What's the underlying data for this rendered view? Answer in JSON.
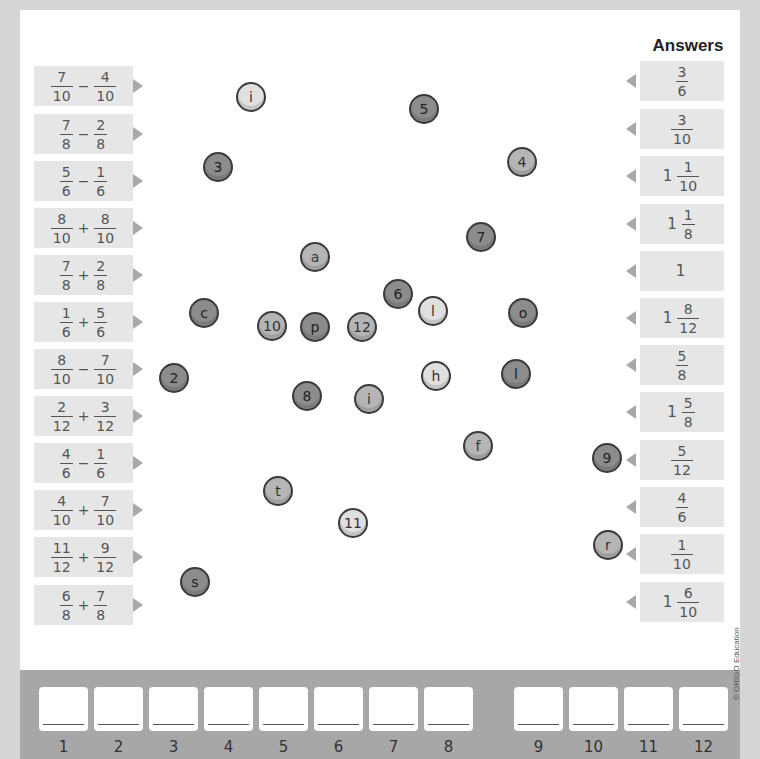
{
  "header": {
    "answers_title": "Answers"
  },
  "questions": [
    {
      "a_num": "7",
      "a_den": "10",
      "op": "−",
      "b_num": "4",
      "b_den": "10"
    },
    {
      "a_num": "7",
      "a_den": "8",
      "op": "−",
      "b_num": "2",
      "b_den": "8"
    },
    {
      "a_num": "5",
      "a_den": "6",
      "op": "−",
      "b_num": "1",
      "b_den": "6"
    },
    {
      "a_num": "8",
      "a_den": "10",
      "op": "+",
      "b_num": "8",
      "b_den": "10"
    },
    {
      "a_num": "7",
      "a_den": "8",
      "op": "+",
      "b_num": "2",
      "b_den": "8"
    },
    {
      "a_num": "1",
      "a_den": "6",
      "op": "+",
      "b_num": "5",
      "b_den": "6"
    },
    {
      "a_num": "8",
      "a_den": "10",
      "op": "−",
      "b_num": "7",
      "b_den": "10"
    },
    {
      "a_num": "2",
      "a_den": "12",
      "op": "+",
      "b_num": "3",
      "b_den": "12"
    },
    {
      "a_num": "4",
      "a_den": "6",
      "op": "−",
      "b_num": "1",
      "b_den": "6"
    },
    {
      "a_num": "4",
      "a_den": "10",
      "op": "+",
      "b_num": "7",
      "b_den": "10"
    },
    {
      "a_num": "11",
      "a_den": "12",
      "op": "+",
      "b_num": "9",
      "b_den": "12"
    },
    {
      "a_num": "6",
      "a_den": "8",
      "op": "+",
      "b_num": "7",
      "b_den": "8"
    }
  ],
  "answers": [
    {
      "whole": "",
      "num": "3",
      "den": "6"
    },
    {
      "whole": "",
      "num": "3",
      "den": "10"
    },
    {
      "whole": "1",
      "num": "1",
      "den": "10"
    },
    {
      "whole": "1",
      "num": "1",
      "den": "8"
    },
    {
      "whole": "1",
      "num": "",
      "den": ""
    },
    {
      "whole": "1",
      "num": "8",
      "den": "12"
    },
    {
      "whole": "",
      "num": "5",
      "den": "8"
    },
    {
      "whole": "1",
      "num": "5",
      "den": "8"
    },
    {
      "whole": "",
      "num": "5",
      "den": "12"
    },
    {
      "whole": "",
      "num": "4",
      "den": "6"
    },
    {
      "whole": "",
      "num": "1",
      "den": "10"
    },
    {
      "whole": "1",
      "num": "6",
      "den": "10"
    }
  ],
  "dots": [
    {
      "label": "i",
      "x": 251,
      "y": 97,
      "shade": "light"
    },
    {
      "label": "5",
      "x": 424,
      "y": 109,
      "shade": "dark"
    },
    {
      "label": "3",
      "x": 218,
      "y": 167,
      "shade": "dark"
    },
    {
      "label": "4",
      "x": 522,
      "y": 162,
      "shade": "mid"
    },
    {
      "label": "7",
      "x": 481,
      "y": 237,
      "shade": "dark"
    },
    {
      "label": "a",
      "x": 315,
      "y": 257,
      "shade": "mid"
    },
    {
      "label": "6",
      "x": 398,
      "y": 294,
      "shade": "dark"
    },
    {
      "label": "l",
      "x": 433,
      "y": 311,
      "shade": "light"
    },
    {
      "label": "o",
      "x": 523,
      "y": 313,
      "shade": "dark"
    },
    {
      "label": "c",
      "x": 204,
      "y": 313,
      "shade": "dark"
    },
    {
      "label": "10",
      "x": 272,
      "y": 326,
      "shade": "mid"
    },
    {
      "label": "p",
      "x": 315,
      "y": 327,
      "shade": "dark"
    },
    {
      "label": "12",
      "x": 362,
      "y": 327,
      "shade": "mid"
    },
    {
      "label": "2",
      "x": 174,
      "y": 378,
      "shade": "dark"
    },
    {
      "label": "h",
      "x": 436,
      "y": 376,
      "shade": "light"
    },
    {
      "label": "l",
      "x": 516,
      "y": 374,
      "shade": "dark"
    },
    {
      "label": "8",
      "x": 307,
      "y": 396,
      "shade": "dark"
    },
    {
      "label": "i",
      "x": 369,
      "y": 399,
      "shade": "mid"
    },
    {
      "label": "f",
      "x": 478,
      "y": 446,
      "shade": "mid"
    },
    {
      "label": "9",
      "x": 607,
      "y": 458,
      "shade": "dark"
    },
    {
      "label": "t",
      "x": 278,
      "y": 491,
      "shade": "mid"
    },
    {
      "label": "11",
      "x": 353,
      "y": 523,
      "shade": "light"
    },
    {
      "label": "r",
      "x": 608,
      "y": 545,
      "shade": "mid"
    },
    {
      "label": "s",
      "x": 195,
      "y": 582,
      "shade": "dark"
    }
  ],
  "slots": [
    "1",
    "2",
    "3",
    "4",
    "5",
    "6",
    "7",
    "8",
    "9",
    "10",
    "11",
    "12"
  ],
  "copyright": "© ORIGO Education"
}
